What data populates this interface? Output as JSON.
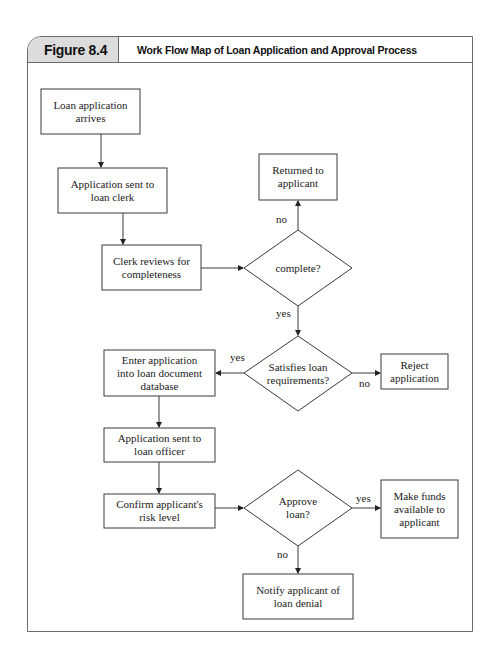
{
  "figure": {
    "label": "Figure 8.4",
    "title": "Work Flow Map of Loan Application and Approval Process"
  },
  "nodes": {
    "arrives": "Loan application\narrives",
    "clerk": "Application sent to\nloan clerk",
    "review": "Clerk reviews for\ncompleteness",
    "complete": "complete?",
    "returned": "Returned to\napplicant",
    "satisfies": "Satisfies loan\nrequirements?",
    "reject": "Reject\napplication",
    "enter": "Enter application\ninto loan document\ndatabase",
    "officer": "Application sent to\nloan officer",
    "confirm": "Confirm applicant's\nrisk level",
    "approve": "Approve\nloan?",
    "funds": "Make funds\navailable to\napplicant",
    "notify": "Notify applicant of\nloan denial"
  },
  "edge_labels": {
    "complete_no": "no",
    "complete_yes": "yes",
    "satisfies_yes": "yes",
    "satisfies_no": "no",
    "approve_yes": "yes",
    "approve_no": "no"
  },
  "colors": {
    "stroke": "#3a3a3a",
    "header_fill": "#dcdcdc"
  }
}
